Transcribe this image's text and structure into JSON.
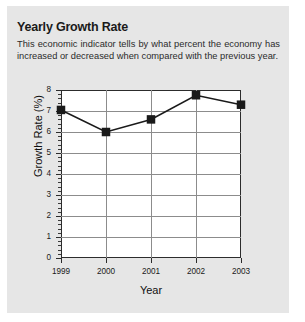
{
  "card": {
    "title": "Yearly Growth Rate",
    "subtitle": "This economic indicator tells by what percent the economy has increased or decreased when compared with the previous year.",
    "background_color": "#e6e6e6",
    "page_background_color": "#ffffff"
  },
  "chart_data": {
    "type": "line",
    "title": "Yearly Growth Rate",
    "subtitle": "This economic indicator tells by what percent the economy has increased or decreased when compared with the previous year.",
    "xlabel": "Year",
    "ylabel": "Growth Rate (%)",
    "categories": [
      "1999",
      "2000",
      "2001",
      "2002",
      "2003"
    ],
    "values": [
      7.05,
      6.0,
      6.6,
      7.75,
      7.3
    ],
    "series": [
      {
        "name": "Growth Rate",
        "values": [
          7.05,
          6.0,
          6.6,
          7.75,
          7.3
        ]
      }
    ],
    "ylim": [
      0,
      8
    ],
    "xlim": [
      "1999",
      "2003"
    ],
    "ytick_labels": [
      "0",
      "1",
      "2",
      "3",
      "4",
      "5",
      "6",
      "7",
      "8"
    ],
    "ytick_values": [
      0,
      1,
      2,
      3,
      4,
      5,
      6,
      7,
      8
    ],
    "y_minor_ticks_per_interval": 5,
    "xtick_labels": [
      "1999",
      "2000",
      "2001",
      "2002",
      "2003"
    ],
    "grid": "both",
    "legend": "none",
    "marker": "square",
    "marker_color": "#1a1a1a",
    "line_color": "#1a1a1a",
    "plot_background_color": "#ffffff",
    "gridline_color": "#8c8c8c",
    "axis_color": "#2c2c2c"
  }
}
